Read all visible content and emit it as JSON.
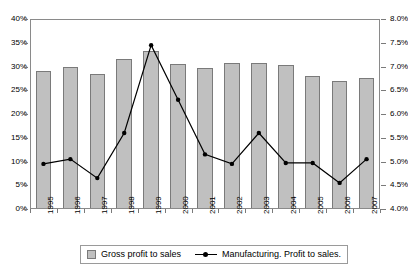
{
  "chart_data": {
    "type": "bar",
    "title": "",
    "xlabel": "",
    "categories": [
      "1995",
      "1996",
      "1997",
      "1998",
      "1999",
      "2000",
      "2001",
      "2002",
      "2003",
      "2004",
      "2005",
      "2006",
      "2007"
    ],
    "grid": false,
    "legend_position": "bottom",
    "series": [
      {
        "name": "Gross profit to sales",
        "type": "bar",
        "axis": "left",
        "values": [
          29.0,
          29.8,
          28.5,
          31.6,
          33.3,
          30.5,
          29.6,
          30.8,
          30.8,
          30.3,
          28.0,
          27.0,
          27.5
        ]
      },
      {
        "name": "Manufacturing. Profit to sales.",
        "type": "line",
        "axis": "right",
        "values": [
          4.95,
          5.05,
          4.65,
          5.6,
          7.45,
          6.3,
          5.15,
          4.95,
          5.6,
          4.97,
          4.97,
          4.55,
          5.05
        ]
      }
    ],
    "axes": {
      "left": {
        "label": "",
        "ylim": [
          0,
          40
        ],
        "tick_step": 5,
        "ticks": [
          "0%",
          "5%",
          "10%",
          "15%",
          "20%",
          "25%",
          "30%",
          "35%",
          "40%"
        ]
      },
      "right": {
        "label": "",
        "ylim": [
          4.0,
          8.0
        ],
        "tick_step": 0.5,
        "ticks": [
          "4.0%",
          "4.5%",
          "5.0%",
          "5.5%",
          "6.0%",
          "6.5%",
          "7.0%",
          "7.5%",
          "8.0%"
        ]
      }
    },
    "colors": {
      "bar_fill": "#c0c0c0",
      "bar_border": "#7a7a7a",
      "line": "#000000",
      "marker": "#000000",
      "frame": "#8a8a8a",
      "background": "#ffffff"
    }
  },
  "legend": {
    "items": [
      {
        "label": "Gross profit to sales",
        "marker": "bar-swatch"
      },
      {
        "label": "Manufacturing. Profit to sales.",
        "marker": "line-marker"
      }
    ]
  }
}
